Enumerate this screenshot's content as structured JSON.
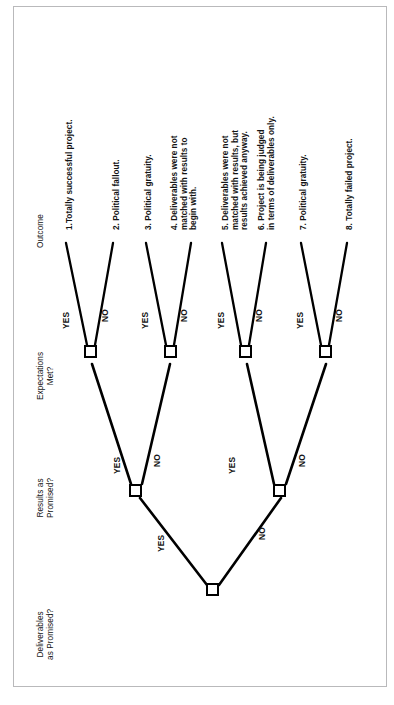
{
  "figure": {
    "type": "decision-tree",
    "orientation": "rotated-90-counterclockwise",
    "border_color": "#b9b9bb",
    "line_color": "#000000",
    "text_color": "#141414",
    "background": "#ffffff"
  },
  "columns": [
    {
      "id": "deliverables",
      "label": "Deliverables\nas Promised?"
    },
    {
      "id": "results",
      "label": "Results as\nPromised?"
    },
    {
      "id": "expectations",
      "label": "Expectations\nMet?"
    },
    {
      "id": "outcome",
      "label": "Outcome"
    }
  ],
  "branch_labels": {
    "yes": "YES",
    "no": "NO"
  },
  "outcomes": [
    {
      "n": "1",
      "label": "1.Totally successful project."
    },
    {
      "n": "2",
      "label": "2. Political fallout."
    },
    {
      "n": "3",
      "label": "3. Political gratuity."
    },
    {
      "n": "4",
      "label": "4. Deliverables were not\nmatched with results to\nbegin with."
    },
    {
      "n": "5",
      "label": "5. Deliverables were not\nmatched with results, but\nresults achieved anyway."
    },
    {
      "n": "6",
      "label": "6. Project is being judged\nin terms of deliverables only."
    },
    {
      "n": "7",
      "label": "7. Political gratuity."
    },
    {
      "n": "8",
      "label": "8. Totally failed project."
    }
  ],
  "tree": {
    "root": {
      "id": "root",
      "question": "Deliverables as Promised?"
    },
    "level2": [
      {
        "id": "r-yes",
        "from": "root",
        "answer": "YES",
        "question": "Results as Promised?"
      },
      {
        "id": "r-no",
        "from": "root",
        "answer": "NO",
        "question": "Results as Promised?"
      }
    ],
    "level3": [
      {
        "id": "e1",
        "from": "r-yes",
        "answer": "YES",
        "question": "Expectations Met?"
      },
      {
        "id": "e2",
        "from": "r-yes",
        "answer": "NO",
        "question": "Expectations Met?"
      },
      {
        "id": "e3",
        "from": "r-no",
        "answer": "YES",
        "question": "Expectations Met?"
      },
      {
        "id": "e4",
        "from": "r-no",
        "answer": "NO",
        "question": "Expectations Met?"
      }
    ],
    "leaves": [
      {
        "from": "e1",
        "answer": "YES",
        "outcome": "1"
      },
      {
        "from": "e1",
        "answer": "NO",
        "outcome": "2"
      },
      {
        "from": "e2",
        "answer": "YES",
        "outcome": "3"
      },
      {
        "from": "e2",
        "answer": "NO",
        "outcome": "4"
      },
      {
        "from": "e3",
        "answer": "YES",
        "outcome": "5"
      },
      {
        "from": "e3",
        "answer": "NO",
        "outcome": "6"
      },
      {
        "from": "e4",
        "answer": "YES",
        "outcome": "7"
      },
      {
        "from": "e4",
        "answer": "NO",
        "outcome": "8"
      }
    ]
  }
}
